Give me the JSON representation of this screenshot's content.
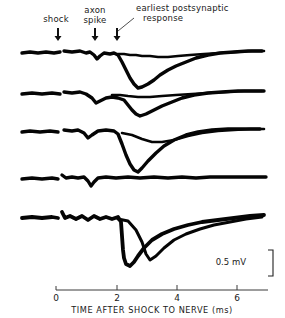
{
  "figure": {
    "type": "electrophysiology-oscilloscope-traces",
    "background_color": "#ffffff",
    "trace_color": "#050505",
    "axis_color": "#3a3a3a"
  },
  "annotations": [
    {
      "id": "shock",
      "label": "shock",
      "lines": [
        "shock"
      ],
      "arrow_x": 58,
      "arrow_y_top": 28,
      "arrow_y_tip": 40,
      "text_x": 56,
      "text_y": 22,
      "anchor": "middle",
      "leader": false
    },
    {
      "id": "axon-spike",
      "label": "axon spike",
      "lines": [
        "axon",
        "spike"
      ],
      "arrow_x": 95,
      "arrow_y_top": 28,
      "arrow_y_tip": 40,
      "text_x": 95,
      "text_y": 13,
      "anchor": "middle",
      "leader": false
    },
    {
      "id": "earliest-postsynaptic-response",
      "label": "earliest postsynaptic response",
      "lines": [
        "earliest postsynaptic",
        "response"
      ],
      "arrow_x": 117,
      "arrow_y_top": 28,
      "arrow_y_tip": 40,
      "text_x": 136,
      "text_y": 11,
      "anchor": "start",
      "leader": true,
      "leader_path": "M 118,30 L 132,20"
    }
  ],
  "xaxis": {
    "title": "TIME AFTER SHOCK TO NERVE (ms)",
    "title_x": 150,
    "title_y": 312,
    "unit": "ms",
    "line_y": 290,
    "line_x_start": 56,
    "line_x_end": 268,
    "ticks": [
      {
        "value": "0",
        "x": 56
      },
      {
        "value": "2",
        "x": 117
      },
      {
        "value": "4",
        "x": 177
      },
      {
        "value": "6",
        "x": 237
      }
    ],
    "range": [
      0,
      7
    ]
  },
  "scale_bar": {
    "label": "0.5 mV",
    "text_x": 246,
    "text_y": 265,
    "bar_path": "M 268,250 L 273,250 L 273,276 L 268,276",
    "value": 0.5,
    "unit": "mV"
  },
  "chart_data": {
    "type": "line",
    "xlabel": "TIME AFTER SHOCK TO NERVE (ms)",
    "ylabel": "",
    "xlim": [
      0,
      7
    ],
    "grid": false,
    "legend": "none",
    "scale_bar_mv": 0.5,
    "annotations": [
      "shock",
      "axon spike",
      "earliest postsynaptic response"
    ],
    "traces": [
      {
        "name": "sweep-1",
        "baseline_y": 52,
        "stub": "M 22,53 L 30,52 L 38,53 L 46,52 L 54,53 L 60,52",
        "main": "M 64,51 L 72,52 L 80,51 L 86,53 L 90,52 L 94,55 L 97,59 L 100,56 L 104,53 L 110,54 L 114,53 L 118,55 L 122,62 L 126,70 L 130,78 L 134,84 L 138,88 L 142,87 L 148,84 L 154,80 L 160,75 L 168,70 L 176,66 L 186,62 L 196,58 L 208,55 L 220,53 L 234,52 L 248,51 L 262,51",
        "overlay": "M 118,54 L 124,54 L 130,55 L 136,55 L 142,56 L 150,56 L 158,57 L 168,57 L 178,56 L 190,55 L 204,54 L 220,53 L 236,52 L 252,51 L 264,51"
      },
      {
        "name": "sweep-2",
        "baseline_y": 93,
        "stub": "M 22,94 L 32,93 L 42,94 L 52,93 L 60,94",
        "main": "M 64,92 L 72,93 L 80,92 L 86,94 L 92,98 L 96,103 L 100,101 L 106,98 L 112,97 L 118,98 L 124,100 L 128,105 L 132,110 L 136,114 L 140,116 L 146,114 L 154,110 L 162,106 L 172,102 L 182,98 L 194,95 L 208,93 L 222,92 L 238,91 L 252,91 L 264,91",
        "overlay": "M 112,95 L 120,95 L 128,96 L 138,97 L 150,97 L 162,96 L 176,95 L 192,94 L 208,93 L 226,92 L 244,91 L 262,91"
      },
      {
        "name": "sweep-3",
        "baseline_y": 131,
        "stub": "M 22,132 L 30,131 L 40,132 L 50,131 L 58,132",
        "main": "M 64,130 L 72,131 L 78,130 L 84,133 L 88,138 L 92,135 L 98,131 L 106,130 L 114,131 L 118,134 L 122,144 L 126,155 L 130,164 L 134,170 L 138,172 L 142,168 L 148,161 L 156,153 L 164,146 L 174,140 L 186,135 L 198,132 L 212,130 L 228,129 L 244,129 L 260,129",
        "overlay": "M 122,133 L 132,135 L 142,139 L 152,142 L 162,142 L 174,140 L 188,136 L 202,133 L 218,131 L 234,130 L 250,129 L 264,129"
      },
      {
        "name": "sweep-4",
        "baseline_y": 178,
        "stub": "M 22,179 L 32,178 L 42,179 L 52,178 L 58,179",
        "main": "M 62,175 L 66,178 L 72,177 L 78,178 L 84,177 L 88,181 L 91,186 L 94,182 L 98,178 L 106,177 L 116,178 L 128,177 L 140,178 L 154,177 L 168,178 L 182,177 L 196,178 L 210,177 L 226,177 L 242,177 L 258,177 L 266,177",
        "overlay": ""
      },
      {
        "name": "sweep-5",
        "baseline_y": 217,
        "stub": "M 22,218 L 32,217 L 42,218 L 52,217 L 58,218",
        "main": "M 62,212 L 65,218 L 70,216 L 76,219 L 82,216 L 88,220 L 94,216 L 100,219 L 106,217 L 112,219 L 118,217 L 121,222 L 122,236 L 123,250 L 124,258 L 126,264 L 130,266 L 134,262 L 138,256 L 144,248 L 152,240 L 162,234 L 174,229 L 188,225 L 202,222 L 218,220 L 234,218 L 250,216 L 264,215",
        "overlay": "M 118,219 L 128,221 L 136,230 L 142,242 L 146,254 L 150,260 L 156,256 L 164,248 L 174,240 L 186,234 L 200,229 L 214,225 L 230,222 L 246,219 L 262,217"
      }
    ]
  }
}
